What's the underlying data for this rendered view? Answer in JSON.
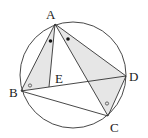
{
  "diagram": {
    "type": "geometry",
    "circle": {
      "cx": 73,
      "cy": 75,
      "r": 53
    },
    "points": {
      "A": {
        "label": "A",
        "x": 55,
        "y": 24
      },
      "B": {
        "label": "B",
        "x": 21,
        "y": 91
      },
      "C": {
        "label": "C",
        "x": 108,
        "y": 116
      },
      "D": {
        "label": "D",
        "x": 126,
        "y": 76
      },
      "E": {
        "label": "E",
        "x": 49,
        "y": 87
      }
    },
    "segments": [
      "AB",
      "AC",
      "AD",
      "AE",
      "BD",
      "BC",
      "CD"
    ],
    "shaded_regions": [
      "ABE",
      "ACD"
    ],
    "angle_marks": [
      {
        "vertex": "A",
        "between": [
          "B",
          "E"
        ],
        "mark": "filled-dot"
      },
      {
        "vertex": "A",
        "between": [
          "C",
          "D"
        ],
        "mark": "filled-dot"
      },
      {
        "vertex": "B",
        "between": [
          "A",
          "D"
        ],
        "mark": "open-circle"
      },
      {
        "vertex": "C",
        "between": [
          "A",
          "D"
        ],
        "mark": "open-circle"
      }
    ],
    "colors": {
      "line": "#333333",
      "shade": "#e6e6e6",
      "background": "#ffffff"
    }
  }
}
